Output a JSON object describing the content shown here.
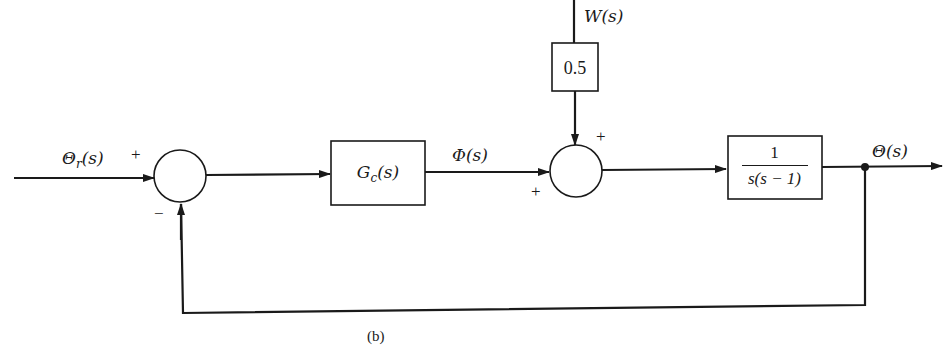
{
  "diagram": {
    "type": "block-diagram",
    "caption": "(b)",
    "input": {
      "label": "Θ",
      "subscript": "r",
      "suffix": "(s)"
    },
    "summing_junction_1": {
      "signs": {
        "top_left": "+",
        "bottom": "−"
      }
    },
    "controller": {
      "label": "G",
      "subscript": "c",
      "suffix": "(s)"
    },
    "controller_output": {
      "label": "Φ(s)"
    },
    "disturbance": {
      "label": "W(s)",
      "gain": "0.5"
    },
    "summing_junction_2": {
      "signs": {
        "top_right": "+",
        "bottom_left": "+"
      }
    },
    "plant": {
      "numerator": "1",
      "denominator": "s(s − 1)"
    },
    "output": {
      "label": "Θ(s)"
    },
    "feedback": {
      "type": "unity",
      "sign": "−"
    },
    "colors": {
      "stroke": "#1a1a1a",
      "background": "#ffffff"
    }
  }
}
